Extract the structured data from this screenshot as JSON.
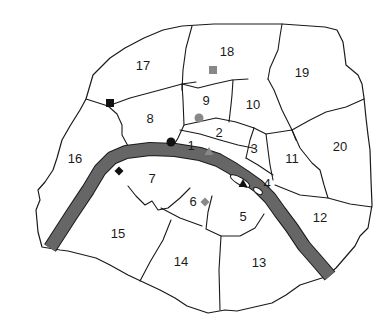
{
  "map": {
    "title": "Paris arrondissements",
    "colors": {
      "river": "#666666",
      "outline": "#1a1a1a",
      "marker_black": "#111111",
      "marker_gray": "#888888",
      "background": "#ffffff"
    },
    "arrondissements": [
      {
        "id": "1",
        "label": "1",
        "x": 191,
        "y": 145
      },
      {
        "id": "2",
        "label": "2",
        "x": 219,
        "y": 132
      },
      {
        "id": "3",
        "label": "3",
        "x": 254,
        "y": 148
      },
      {
        "id": "4",
        "label": "4",
        "x": 267,
        "y": 183
      },
      {
        "id": "5",
        "label": "5",
        "x": 243,
        "y": 216
      },
      {
        "id": "6",
        "label": "6",
        "x": 193,
        "y": 201
      },
      {
        "id": "7",
        "label": "7",
        "x": 152,
        "y": 178
      },
      {
        "id": "8",
        "label": "8",
        "x": 150,
        "y": 118
      },
      {
        "id": "9",
        "label": "9",
        "x": 206,
        "y": 100
      },
      {
        "id": "10",
        "label": "10",
        "x": 253,
        "y": 104
      },
      {
        "id": "11",
        "label": "11",
        "x": 292,
        "y": 158
      },
      {
        "id": "12",
        "label": "12",
        "x": 320,
        "y": 217
      },
      {
        "id": "13",
        "label": "13",
        "x": 259,
        "y": 262
      },
      {
        "id": "14",
        "label": "14",
        "x": 181,
        "y": 261
      },
      {
        "id": "15",
        "label": "15",
        "x": 118,
        "y": 233
      },
      {
        "id": "16",
        "label": "16",
        "x": 75,
        "y": 158
      },
      {
        "id": "17",
        "label": "17",
        "x": 143,
        "y": 65
      },
      {
        "id": "18",
        "label": "18",
        "x": 227,
        "y": 51
      },
      {
        "id": "19",
        "label": "19",
        "x": 302,
        "y": 72
      },
      {
        "id": "20",
        "label": "20",
        "x": 340,
        "y": 146
      }
    ],
    "markers": [
      {
        "name": "black-square-marker",
        "shape": "square",
        "color": "#111111",
        "x": 110,
        "y": 103,
        "arrondissement": "17"
      },
      {
        "name": "gray-square-marker",
        "shape": "square",
        "color": "#888888",
        "x": 213,
        "y": 70,
        "arrondissement": "18"
      },
      {
        "name": "gray-circle-marker",
        "shape": "circle",
        "color": "#888888",
        "x": 199,
        "y": 118,
        "arrondissement": "9"
      },
      {
        "name": "black-circle-marker",
        "shape": "circle",
        "color": "#111111",
        "x": 171,
        "y": 142,
        "arrondissement": "8"
      },
      {
        "name": "gray-triangle-marker",
        "shape": "triangle",
        "color": "#888888",
        "x": 209,
        "y": 151,
        "arrondissement": "1"
      },
      {
        "name": "black-triangle-marker",
        "shape": "triangle",
        "color": "#111111",
        "x": 243,
        "y": 183,
        "arrondissement": "4"
      },
      {
        "name": "black-diamond-marker",
        "shape": "diamond",
        "color": "#111111",
        "x": 119,
        "y": 171,
        "arrondissement": "16"
      },
      {
        "name": "gray-diamond-marker",
        "shape": "diamond",
        "color": "#888888",
        "x": 205,
        "y": 202,
        "arrondissement": "6"
      }
    ]
  }
}
